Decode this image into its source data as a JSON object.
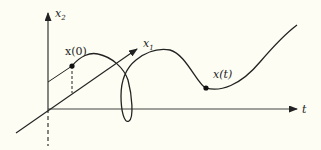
{
  "figure": {
    "type": "state-space trajectory diagram",
    "axes": {
      "vertical": {
        "label": "x",
        "subscript": "2"
      },
      "diagonal": {
        "label": "x",
        "subscript": "1"
      },
      "horizontal": {
        "label": "t"
      }
    },
    "points": [
      {
        "name": "initial-state",
        "label": "x(0)"
      },
      {
        "name": "state-at-t",
        "label": "x(t)"
      }
    ],
    "colors": {
      "background": "#fdfdf3",
      "ink": "#222222"
    }
  }
}
